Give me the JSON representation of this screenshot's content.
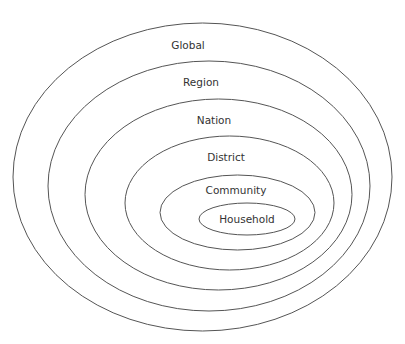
{
  "diagram": {
    "type": "nested-ellipses",
    "stroke_color": "#555555",
    "text_color": "#333333",
    "levels": [
      {
        "label": "Global",
        "cx": 202.5,
        "cy": 177,
        "rx": 189.5,
        "ry": 154,
        "lx": 188,
        "ly": 49
      },
      {
        "label": "Region",
        "cx": 209,
        "cy": 186,
        "rx": 161,
        "ry": 125,
        "lx": 201,
        "ly": 86
      },
      {
        "label": "Nation",
        "cx": 218.5,
        "cy": 194.5,
        "rx": 133.5,
        "ry": 95.5,
        "lx": 214,
        "ly": 124
      },
      {
        "label": "District",
        "cx": 229.5,
        "cy": 203,
        "rx": 104.5,
        "ry": 67,
        "lx": 226,
        "ly": 161
      },
      {
        "label": "Community",
        "cx": 237.5,
        "cy": 212.5,
        "rx": 77.5,
        "ry": 37.5,
        "lx": 236,
        "ly": 194
      },
      {
        "label": "Household",
        "cx": 247,
        "cy": 219,
        "rx": 48,
        "ry": 16,
        "lx": 247,
        "ly": 223
      }
    ]
  }
}
